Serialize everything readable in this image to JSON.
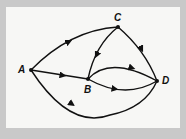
{
  "diagram": {
    "type": "directed-graph",
    "nodes": [
      {
        "id": "A",
        "label": "A",
        "x": 31,
        "y": 70
      },
      {
        "id": "B",
        "label": "B",
        "x": 88,
        "y": 79
      },
      {
        "id": "C",
        "label": "C",
        "x": 118,
        "y": 27
      },
      {
        "id": "D",
        "label": "D",
        "x": 157,
        "y": 81
      }
    ],
    "edges": [
      {
        "from": "A",
        "to": "C"
      },
      {
        "from": "A",
        "to": "B"
      },
      {
        "from": "A",
        "to": "D"
      },
      {
        "from": "C",
        "to": "B"
      },
      {
        "from": "C",
        "to": "D"
      },
      {
        "from": "B",
        "to": "D",
        "route": "upper"
      },
      {
        "from": "B",
        "to": "D",
        "route": "lower"
      }
    ],
    "colors": {
      "background": "#c9c9c9",
      "panel": "#f7f7f5",
      "ink": "#111111"
    }
  }
}
